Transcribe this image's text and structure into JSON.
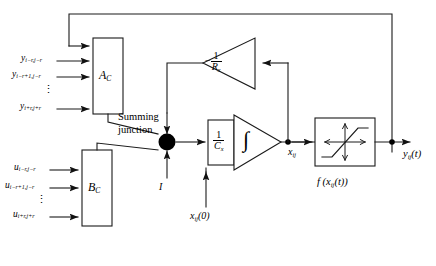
{
  "diagram": {
    "stroke_color": "#1a1a1a",
    "fill_color": "#000000",
    "background": "#ffffff"
  },
  "blocks": {
    "a_template": {
      "label": "A",
      "sub": "C",
      "name": "a-template-block"
    },
    "b_template": {
      "label": "B",
      "sub": "C",
      "name": "b-template-block"
    },
    "resistor_gain": {
      "sign": "−",
      "numerator": "1",
      "denominator": "R",
      "den_sub": "x"
    },
    "capacitor_gain": {
      "numerator": "1",
      "denominator": "C",
      "den_sub": "x"
    },
    "integrator": {
      "symbol": "∫"
    },
    "output_nonlinearity": {
      "caption": "f (x",
      "caption_sub": "ij",
      "caption_tail": "(t))"
    }
  },
  "nodes": {
    "summing_junction": {
      "line1": "Summing",
      "line2": "junction"
    },
    "current_label": "I",
    "state_label": {
      "base": "x",
      "sub": "ij"
    },
    "initial_condition": {
      "base": "x",
      "sub": "ij",
      "tail": "(0)"
    },
    "output_label": {
      "base": "y",
      "sub": "ij",
      "tail": "(t)"
    }
  },
  "inputs": {
    "y_group": {
      "items": [
        {
          "base": "y",
          "sub": "i−r,j−r"
        },
        {
          "base": "y",
          "sub": "i−r+1,j−r"
        },
        {
          "base": "y",
          "sub": "i+r,j+r"
        }
      ],
      "ellipsis": "⋮"
    },
    "u_group": {
      "items": [
        {
          "base": "u",
          "sub": "i−r,j−r"
        },
        {
          "base": "u",
          "sub": "i−r+1,j−r"
        },
        {
          "base": "u",
          "sub": "i+r,j+r"
        }
      ],
      "ellipsis": "⋮"
    }
  }
}
